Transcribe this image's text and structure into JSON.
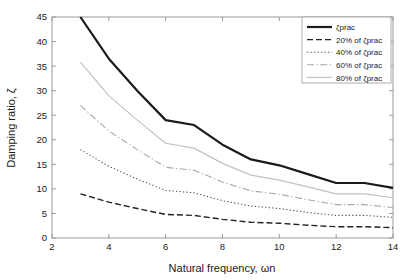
{
  "chart_data": {
    "type": "line",
    "title": "",
    "xlabel": "Natural frequency, ωn",
    "ylabel": "Damping ratio, ζ",
    "xlim": [
      2,
      14
    ],
    "ylim": [
      0,
      45
    ],
    "xticks": [
      2,
      4,
      6,
      8,
      10,
      12,
      14
    ],
    "yticks": [
      0,
      5,
      10,
      15,
      20,
      25,
      30,
      35,
      40,
      45
    ],
    "xticklabels": [
      "2",
      "4",
      "6",
      "8",
      "10",
      "12",
      "14"
    ],
    "yticklabels": [
      "0",
      "5",
      "10",
      "15",
      "20",
      "25",
      "30",
      "35",
      "40",
      "45"
    ],
    "grid": false,
    "legend_position": "upper right",
    "x": [
      3,
      4,
      5,
      6,
      7,
      8,
      9,
      10,
      11,
      12,
      13,
      14
    ],
    "series": [
      {
        "name": "ζprac",
        "linestyle": "solid",
        "color": "#1a1a1a",
        "linewidth": 2.2,
        "values": [
          45.0,
          36.5,
          30.0,
          24.0,
          23.0,
          19.0,
          16.0,
          14.8,
          13.0,
          11.2,
          11.2,
          10.2
        ]
      },
      {
        "name": "80% of ζprac",
        "linestyle": "solid-light",
        "color": "#c2c2c2",
        "linewidth": 1.2,
        "values": [
          35.8,
          29.0,
          24.0,
          19.3,
          18.3,
          15.2,
          12.8,
          11.8,
          10.4,
          9.0,
          9.0,
          8.2
        ]
      },
      {
        "name": "60% of ζprac",
        "linestyle": "dashdot",
        "color": "#a8a8a8",
        "linewidth": 1.1,
        "values": [
          27.0,
          21.8,
          18.0,
          14.4,
          13.8,
          11.4,
          9.6,
          8.9,
          7.8,
          6.8,
          6.8,
          6.2
        ]
      },
      {
        "name": "40% of ζprac",
        "linestyle": "dotted",
        "color": "#555555",
        "linewidth": 1.1,
        "values": [
          18.0,
          14.6,
          12.0,
          9.7,
          9.2,
          7.6,
          6.5,
          6.0,
          5.2,
          4.6,
          4.6,
          4.2
        ]
      },
      {
        "name": "20% of ζprac",
        "linestyle": "dashed",
        "color": "#222222",
        "linewidth": 1.4,
        "values": [
          9.0,
          7.3,
          6.0,
          4.8,
          4.6,
          3.8,
          3.2,
          3.0,
          2.6,
          2.3,
          2.3,
          2.1
        ]
      }
    ]
  },
  "legend": {
    "entries": [
      {
        "label": "ζprac"
      },
      {
        "label": "20% of ζprac"
      },
      {
        "label": "40% of ζprac"
      },
      {
        "label": "60% of ζprac"
      },
      {
        "label": "80% of ζprac"
      }
    ]
  },
  "axes": {
    "x_title": "Natural frequency, ωn",
    "y_title": "Damping ratio, ζ"
  }
}
